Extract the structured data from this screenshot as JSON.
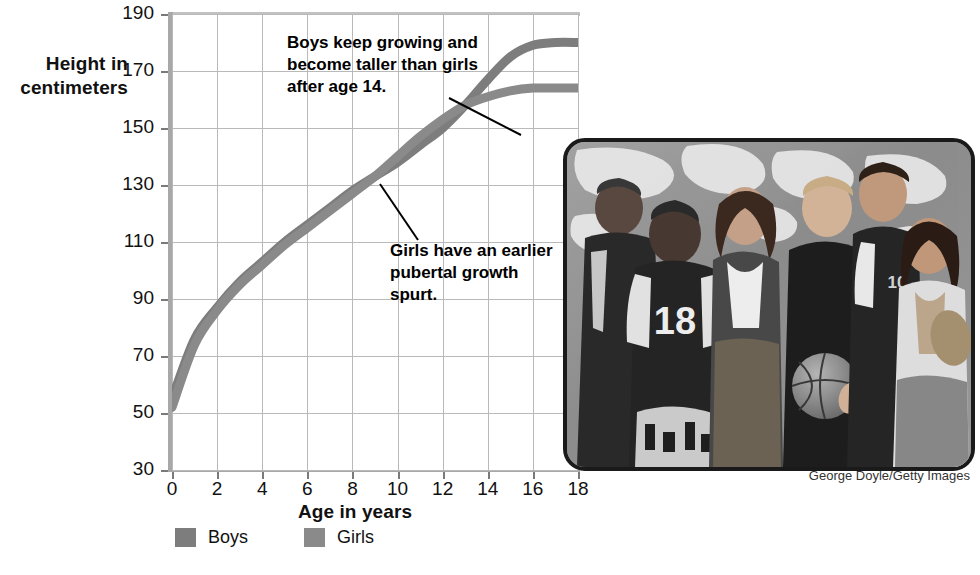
{
  "figure": {
    "y_axis_title": "Height in\ncentimeters",
    "x_axis_title": "Age in years",
    "photo_credit": "George Doyle/Getty Images"
  },
  "legend": {
    "position": "bottom-left",
    "items": [
      {
        "label": "Boys",
        "color": "#7d7d7d"
      },
      {
        "label": "Girls",
        "color": "#8a8a8a"
      }
    ]
  },
  "annotations": [
    {
      "name": "boys-note",
      "text": "Boys keep growing and become taller than girls after age 14."
    },
    {
      "name": "girls-note",
      "text": "Girls have an earlier pubertal growth spurt."
    }
  ],
  "chart_data": {
    "type": "line",
    "title": "",
    "xlabel": "Age in years",
    "ylabel": "Height in centimeters",
    "xlim": [
      0,
      18
    ],
    "ylim": [
      30,
      190
    ],
    "xticks": [
      0,
      2,
      4,
      6,
      8,
      10,
      12,
      14,
      16,
      18
    ],
    "yticks": [
      30,
      50,
      70,
      90,
      110,
      130,
      150,
      170,
      190
    ],
    "grid": true,
    "legend_position": "below-axes",
    "x": [
      0,
      1,
      2,
      3,
      4,
      5,
      6,
      7,
      8,
      9,
      10,
      11,
      12,
      13,
      14,
      15,
      16,
      17,
      18
    ],
    "series": [
      {
        "name": "Boys",
        "color": "#7d7d7d",
        "values": [
          55,
          76,
          87,
          96,
          103,
          110,
          116,
          122,
          128,
          133,
          138,
          144,
          150,
          158,
          167,
          175,
          179,
          180,
          180
        ]
      },
      {
        "name": "Girls",
        "color": "#8a8a8a",
        "values": [
          52,
          74,
          86,
          95,
          102,
          109,
          115,
          121,
          127,
          133,
          140,
          147,
          153,
          158,
          161,
          163,
          164,
          164,
          164
        ]
      }
    ],
    "annotations": [
      {
        "text": "Boys keep growing and become taller than girls after age 14.",
        "points_to": {
          "x": 15.2,
          "y": 172
        }
      },
      {
        "text": "Girls have an earlier pubertal growth spurt.",
        "points_to": {
          "x": 11.2,
          "y": 142
        }
      }
    ]
  }
}
